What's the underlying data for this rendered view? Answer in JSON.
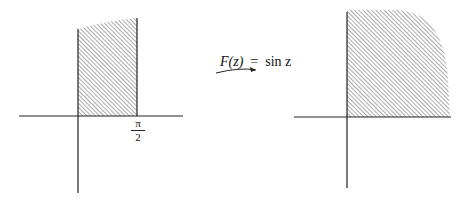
{
  "mapping": {
    "function_name": "F(z)",
    "equals": "=",
    "expression": "sin z"
  },
  "left_plane": {
    "tick_label_numerator": "π",
    "tick_label_denominator": "2"
  },
  "colors": {
    "axis": "#222222",
    "hatch": "#555555",
    "background": "#ffffff"
  }
}
